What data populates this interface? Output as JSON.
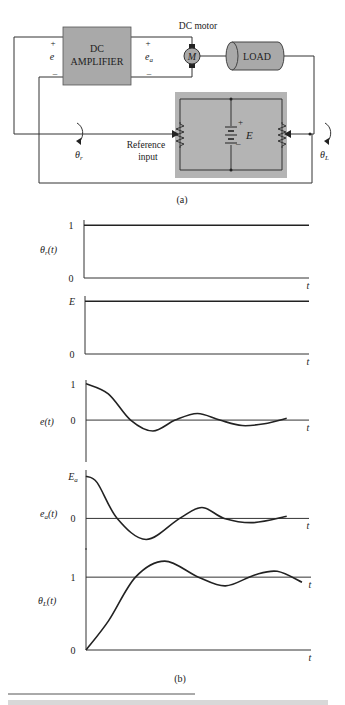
{
  "figure": {
    "panel_a_label": "(a)",
    "panel_b_label": "(b)",
    "caption_visible": false
  },
  "diagram": {
    "amplifier": {
      "line1": "DC",
      "line2": "AMPLIFIER"
    },
    "input_terminals": {
      "plus": "+",
      "minus": "–",
      "var": "e"
    },
    "output_terminals": {
      "plus": "+",
      "minus": "–",
      "var": "e",
      "sub": "a"
    },
    "motor_label": "DC motor",
    "motor_symbol": "M",
    "load_label": "LOAD",
    "battery": {
      "plus": "+",
      "minus": "–",
      "var": "E"
    },
    "reference_input_line1": "Reference",
    "reference_input_line2": "input",
    "theta_r": {
      "sym": "θ",
      "sub": "r"
    },
    "theta_L": {
      "sym": "θ",
      "sub": "L"
    },
    "colors": {
      "block_fill": "#a9a9a9",
      "panel_fill": "#b4b4b4",
      "wire": "#333333"
    }
  },
  "chart_data": [
    {
      "type": "line",
      "title": "",
      "ylabel": "θr(t)",
      "xlabel": "t",
      "ytick_labels": [
        "1",
        "0"
      ],
      "yticks": [
        1,
        0
      ],
      "ylim": [
        0,
        1.1
      ],
      "x": [
        0,
        1
      ],
      "series": [
        {
          "name": "theta_r",
          "values": [
            1,
            1
          ]
        }
      ],
      "description": "unit step reference input"
    },
    {
      "type": "line",
      "ylabel": "",
      "xlabel": "t",
      "ytick_labels": [
        "E",
        "0"
      ],
      "yticks": [
        1,
        0
      ],
      "ylim": [
        0,
        1.1
      ],
      "x": [
        0,
        1
      ],
      "series": [
        {
          "name": "E",
          "values": [
            1,
            1
          ]
        }
      ],
      "description": "constant bridge voltage E"
    },
    {
      "type": "line",
      "ylabel": "e(t)",
      "xlabel": "t",
      "ytick_labels": [
        "1",
        "0"
      ],
      "yticks": [
        1,
        0
      ],
      "ylim": [
        -1.15,
        1.1
      ],
      "x": [
        0,
        0.1,
        0.2,
        0.3,
        0.4,
        0.5,
        0.6,
        0.7,
        0.8,
        0.9
      ],
      "series": [
        {
          "name": "e",
          "values": [
            1.0,
            0.72,
            0.0,
            -0.3,
            0.0,
            0.18,
            0.0,
            -0.15,
            -0.1,
            0.05
          ]
        }
      ],
      "description": "damped oscillating error signal"
    },
    {
      "type": "line",
      "ylabel": "ea(t)",
      "xlabel": "t",
      "ytick_labels": [
        "Ea",
        "0"
      ],
      "yticks": [
        1,
        0
      ],
      "ylim": [
        -0.75,
        1.15
      ],
      "x": [
        0,
        0.05,
        0.14,
        0.27,
        0.42,
        0.52,
        0.62,
        0.75,
        0.9
      ],
      "series": [
        {
          "name": "ea",
          "values": [
            1.0,
            0.85,
            0.0,
            -0.5,
            0.0,
            0.26,
            0.0,
            -0.1,
            0.05
          ]
        }
      ],
      "description": "damped oscillating amplifier output voltage"
    },
    {
      "type": "line",
      "ylabel": "θL(t)",
      "xlabel": "t",
      "ytick_labels": [
        "1",
        "0"
      ],
      "yticks": [
        1,
        0
      ],
      "ylim": [
        0,
        1.4
      ],
      "x": [
        0,
        0.1,
        0.22,
        0.35,
        0.5,
        0.62,
        0.75,
        0.85,
        0.96
      ],
      "series": [
        {
          "name": "theta_L",
          "values": [
            0,
            0.4,
            1.0,
            1.22,
            1.0,
            0.88,
            1.03,
            1.08,
            0.93
          ]
        }
      ],
      "description": "damped oscillating load position settling to 1"
    }
  ]
}
